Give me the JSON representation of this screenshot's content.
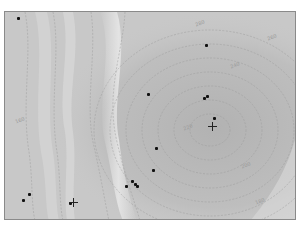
{
  "map": {
    "type": "contour",
    "frame": {
      "x": 4,
      "y": 11,
      "width": 292,
      "height": 209
    },
    "colors": {
      "background": "#c6c6c6",
      "ridge": "#e4e4e4",
      "basin": "#b4b4b4",
      "contour": "#9a9a9a",
      "frame": "#8a8a8a",
      "marker": "#111111"
    },
    "contour_labels": [
      "280",
      "260",
      "240",
      "220",
      "200",
      "180",
      "160"
    ],
    "markers": [
      {
        "x": 17,
        "y": 17
      },
      {
        "x": 205,
        "y": 44
      },
      {
        "x": 147,
        "y": 93
      },
      {
        "x": 203,
        "y": 97
      },
      {
        "x": 206,
        "y": 95
      },
      {
        "x": 213,
        "y": 117
      },
      {
        "x": 155,
        "y": 147
      },
      {
        "x": 152,
        "y": 169
      },
      {
        "x": 131,
        "y": 180
      },
      {
        "x": 134,
        "y": 183
      },
      {
        "x": 136,
        "y": 185
      },
      {
        "x": 125,
        "y": 185
      },
      {
        "x": 28,
        "y": 193
      },
      {
        "x": 22,
        "y": 199
      },
      {
        "x": 69,
        "y": 202
      }
    ],
    "crosses": [
      {
        "x": 212,
        "y": 125
      },
      {
        "x": 72,
        "y": 201
      }
    ]
  }
}
